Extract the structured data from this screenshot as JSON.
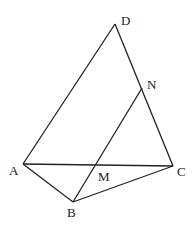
{
  "diagram": {
    "type": "geometry",
    "points": [
      {
        "id": "D",
        "label": "D",
        "x": 115,
        "y": 24,
        "lx": 121,
        "ly": 25
      },
      {
        "id": "N",
        "label": "N",
        "x": 142,
        "y": 88,
        "lx": 147,
        "ly": 89
      },
      {
        "id": "A",
        "label": "A",
        "x": 23,
        "y": 164,
        "lx": 9,
        "ly": 175
      },
      {
        "id": "C",
        "label": "C",
        "x": 173,
        "y": 166,
        "lx": 177,
        "ly": 176
      },
      {
        "id": "M",
        "label": "M",
        "x": 96,
        "y": 165,
        "lx": 98,
        "ly": 181
      },
      {
        "id": "B",
        "label": "B",
        "x": 73,
        "y": 202,
        "lx": 67,
        "ly": 217
      }
    ],
    "segments": [
      [
        "A",
        "D"
      ],
      [
        "D",
        "C"
      ],
      [
        "A",
        "C"
      ],
      [
        "A",
        "B"
      ],
      [
        "B",
        "C"
      ],
      [
        "B",
        "N"
      ]
    ]
  }
}
